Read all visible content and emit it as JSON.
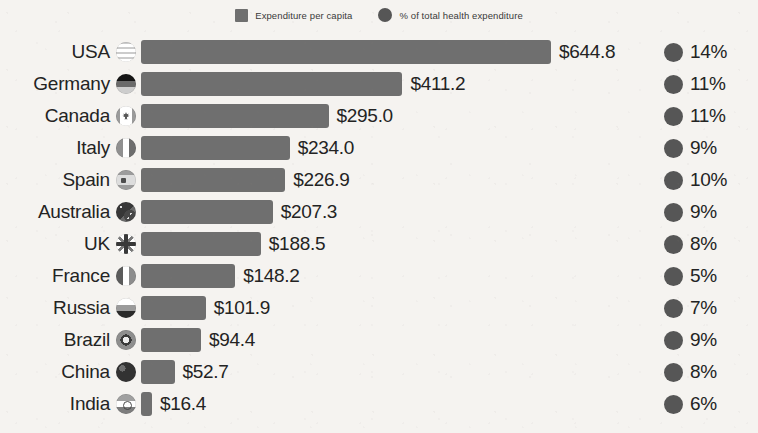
{
  "legend": {
    "items": [
      {
        "label": "Expenditure per capita",
        "marker": "square-swatch-icon",
        "color": "#6f6f6f"
      },
      {
        "label": "% of total health expenditure",
        "marker": "circle-swatch-icon",
        "color": "#565656"
      }
    ]
  },
  "chart_data": {
    "type": "bar",
    "title": "",
    "subtitle": "",
    "xlabel": "",
    "ylabel": "",
    "orientation": "horizontal",
    "grid": false,
    "legend_position": "top-center",
    "xlim": [
      0,
      644.8
    ],
    "categories": [
      "USA",
      "Germany",
      "Canada",
      "Italy",
      "Spain",
      "Australia",
      "UK",
      "France",
      "Russia",
      "Brazil",
      "China",
      "India"
    ],
    "series": [
      {
        "name": "Expenditure per capita",
        "color": "#6f6f6f",
        "values": [
          644.8,
          411.2,
          295.0,
          234.0,
          226.9,
          207.3,
          188.5,
          148.2,
          101.9,
          94.4,
          52.7,
          16.4
        ],
        "labels": [
          "$644.8",
          "$411.2",
          "$295.0",
          "$234.0",
          "$226.9",
          "$207.3",
          "$188.5",
          "$148.2",
          "$101.9",
          "$94.4",
          "$52.7",
          "$16.4"
        ]
      },
      {
        "name": "% of total health expenditure",
        "color": "#565656",
        "values": [
          14,
          11,
          11,
          9,
          10,
          9,
          8,
          5,
          7,
          9,
          8,
          6
        ],
        "labels": [
          "14%",
          "11%",
          "11%",
          "9%",
          "10%",
          "9%",
          "8%",
          "5%",
          "7%",
          "9%",
          "8%",
          "6%"
        ]
      }
    ],
    "rows": [
      {
        "country": "USA",
        "flag": "flag-usa-icon",
        "value": 644.8,
        "value_label": "$644.8",
        "pct": 14,
        "pct_label": "14%"
      },
      {
        "country": "Germany",
        "flag": "flag-germany-icon",
        "value": 411.2,
        "value_label": "$411.2",
        "pct": 11,
        "pct_label": "11%"
      },
      {
        "country": "Canada",
        "flag": "flag-canada-icon",
        "value": 295.0,
        "value_label": "$295.0",
        "pct": 11,
        "pct_label": "11%"
      },
      {
        "country": "Italy",
        "flag": "flag-italy-icon",
        "value": 234.0,
        "value_label": "$234.0",
        "pct": 9,
        "pct_label": "9%"
      },
      {
        "country": "Spain",
        "flag": "flag-spain-icon",
        "value": 226.9,
        "value_label": "$226.9",
        "pct": 10,
        "pct_label": "10%"
      },
      {
        "country": "Australia",
        "flag": "flag-australia-icon",
        "value": 207.3,
        "value_label": "$207.3",
        "pct": 9,
        "pct_label": "9%"
      },
      {
        "country": "UK",
        "flag": "flag-uk-icon",
        "value": 188.5,
        "value_label": "$188.5",
        "pct": 8,
        "pct_label": "8%"
      },
      {
        "country": "France",
        "flag": "flag-france-icon",
        "value": 148.2,
        "value_label": "$148.2",
        "pct": 5,
        "pct_label": "5%"
      },
      {
        "country": "Russia",
        "flag": "flag-russia-icon",
        "value": 101.9,
        "value_label": "$101.9",
        "pct": 7,
        "pct_label": "7%"
      },
      {
        "country": "Brazil",
        "flag": "flag-brazil-icon",
        "value": 94.4,
        "value_label": "$94.4",
        "pct": 9,
        "pct_label": "9%"
      },
      {
        "country": "China",
        "flag": "flag-china-icon",
        "value": 52.7,
        "value_label": "$52.7",
        "pct": 8,
        "pct_label": "8%"
      },
      {
        "country": "India",
        "flag": "flag-india-icon",
        "value": 16.4,
        "value_label": "$16.4",
        "pct": 6,
        "pct_label": "6%"
      }
    ]
  }
}
